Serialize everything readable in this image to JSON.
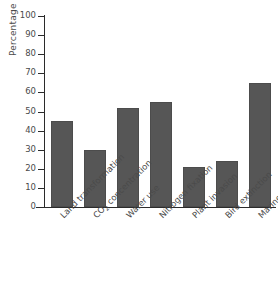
{
  "chart_data": {
    "type": "bar",
    "title": "",
    "xlabel": "",
    "ylabel": "Percentage change",
    "ylim": [
      0,
      100
    ],
    "ytick_labels": [
      "100",
      "90",
      "80",
      "70",
      "60",
      "50",
      "40",
      "30",
      "20",
      "10",
      "0"
    ],
    "ytick_values": [
      100,
      90,
      80,
      70,
      60,
      50,
      40,
      30,
      20,
      10,
      0
    ],
    "grid": false,
    "legend": "none",
    "bar_color": "#565656",
    "categories": [
      "Land transformation",
      "CO2 concentration",
      "Water use",
      "Nitrogen fixation",
      "Plant invasion",
      "Bird extinction",
      "Marine fisheries"
    ],
    "category_labels_html": [
      "Land transformation",
      "CO<sub>2</sub> concentration",
      "Water use",
      "Nitrogen fixation",
      "Plant invasion",
      "Bird extinction",
      "Marine fisheries"
    ],
    "values": [
      45,
      30,
      52,
      55,
      21,
      24,
      65
    ]
  }
}
